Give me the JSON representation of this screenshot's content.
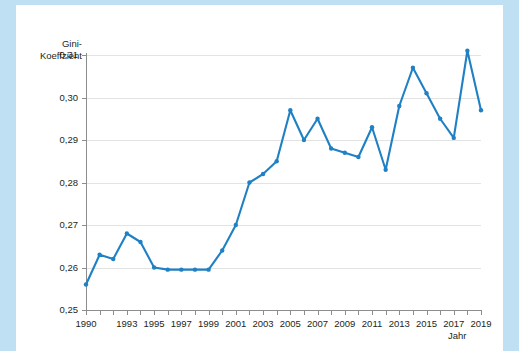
{
  "axes": {
    "ylabel_line1": "Gini-",
    "ylabel_line2": "Koeffzient",
    "xlabel": "Jahr"
  },
  "colors": {
    "line": "#2080c4",
    "marker": "#2080c4",
    "grid": "#e3e3e3",
    "axis": "#8d8d8d",
    "page_border": "#bfe0f2",
    "sheet": "#ffffff",
    "text": "#231f20"
  },
  "chart_data": {
    "type": "line",
    "title": "",
    "xlabel": "Jahr",
    "ylabel": "Gini-Koeffzient",
    "ylim": [
      0.25,
      0.31
    ],
    "xlim": [
      1990,
      2019
    ],
    "grid": true,
    "legend": "none",
    "ytick_labels": [
      "0,31",
      "0,30",
      "0,29",
      "0,28",
      "0,27",
      "0,26",
      "0,25"
    ],
    "ytick_values": [
      0.31,
      0.3,
      0.29,
      0.28,
      0.27,
      0.26,
      0.25
    ],
    "xtick_labels": [
      "1990",
      "1993",
      "1995",
      "1997",
      "1999",
      "2001",
      "2003",
      "2005",
      "2007",
      "2009",
      "2011",
      "2013",
      "2015",
      "2017",
      "2019"
    ],
    "xtick_values": [
      1990,
      1993,
      1995,
      1997,
      1999,
      2001,
      2003,
      2005,
      2007,
      2009,
      2011,
      2013,
      2015,
      2017,
      2019
    ],
    "x": [
      1990,
      1991,
      1992,
      1993,
      1994,
      1995,
      1996,
      1997,
      1998,
      1999,
      2000,
      2001,
      2002,
      2003,
      2004,
      2005,
      2006,
      2007,
      2008,
      2009,
      2010,
      2011,
      2012,
      2013,
      2014,
      2015,
      2016,
      2017,
      2018,
      2019
    ],
    "values": [
      0.256,
      0.263,
      0.262,
      0.268,
      0.266,
      0.26,
      0.2595,
      0.2595,
      0.2595,
      0.2595,
      0.264,
      0.27,
      0.28,
      0.282,
      0.285,
      0.297,
      0.29,
      0.295,
      0.288,
      0.287,
      0.286,
      0.293,
      0.283,
      0.298,
      0.307,
      0.301,
      0.295,
      0.2905,
      0.311,
      0.297
    ]
  }
}
